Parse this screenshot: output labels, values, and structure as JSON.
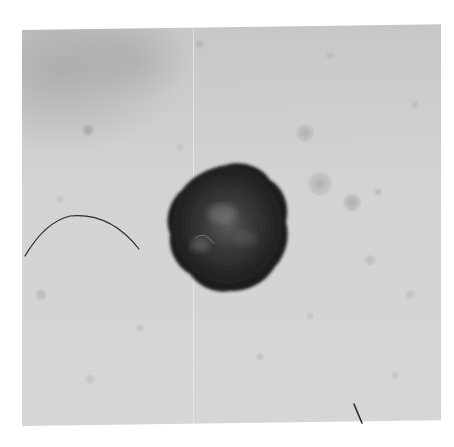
{
  "image": {
    "type": "clinical skin lesion photograph",
    "colorspace": "grayscale",
    "background_color": "#ffffff",
    "frame": {
      "left": 22,
      "top": 30,
      "right": 441,
      "bottom": 426
    },
    "skin_tone": "#d2d2d2"
  },
  "lesion": {
    "label": "pigmented lesion",
    "center": [
      226,
      228
    ],
    "radius_x": 60,
    "radius_y": 64,
    "color_dark": "#1e1e1e",
    "color_mid": "#3a3a3a",
    "color_highlight": "#7a7a7a"
  },
  "spots": [
    {
      "x": 88,
      "y": 131,
      "r": 6,
      "opacity": 0.9
    },
    {
      "x": 305,
      "y": 137,
      "r": 9,
      "opacity": 0.7
    },
    {
      "x": 320,
      "y": 188,
      "r": 12,
      "opacity": 0.75
    },
    {
      "x": 352,
      "y": 207,
      "r": 9,
      "opacity": 0.85
    },
    {
      "x": 378,
      "y": 197,
      "r": 4,
      "opacity": 0.6
    },
    {
      "x": 41,
      "y": 295,
      "r": 6,
      "opacity": 0.6
    },
    {
      "x": 200,
      "y": 47,
      "r": 5,
      "opacity": 0.5
    },
    {
      "x": 370,
      "y": 265,
      "r": 6,
      "opacity": 0.5
    },
    {
      "x": 140,
      "y": 330,
      "r": 4,
      "opacity": 0.45
    },
    {
      "x": 260,
      "y": 360,
      "r": 4,
      "opacity": 0.45
    },
    {
      "x": 410,
      "y": 300,
      "r": 5,
      "opacity": 0.45
    },
    {
      "x": 90,
      "y": 380,
      "r": 5,
      "opacity": 0.4
    },
    {
      "x": 330,
      "y": 60,
      "r": 4,
      "opacity": 0.45
    },
    {
      "x": 415,
      "y": 110,
      "r": 4,
      "opacity": 0.45
    },
    {
      "x": 180,
      "y": 150,
      "r": 4,
      "opacity": 0.4
    },
    {
      "x": 60,
      "y": 200,
      "r": 4,
      "opacity": 0.4
    },
    {
      "x": 310,
      "y": 320,
      "r": 4,
      "opacity": 0.4
    },
    {
      "x": 395,
      "y": 380,
      "r": 4,
      "opacity": 0.4
    }
  ],
  "hairs": [
    {
      "name": "curved-hair",
      "path": "M25 256 Q 45 222 70 216 Q 110 212 139 249",
      "width": 1.2,
      "color": "#2a2a2a"
    },
    {
      "name": "short-hair",
      "path": "M354 404 Q 358 414 362 423",
      "width": 1.6,
      "color": "#2a2a2a"
    }
  ]
}
